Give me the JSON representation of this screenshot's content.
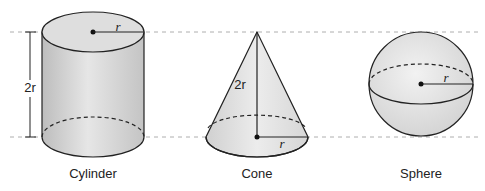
{
  "figure": {
    "shapes": [
      {
        "name": "Cylinder",
        "height_label": "2r",
        "radius_label": "r"
      },
      {
        "name": "Cone",
        "height_label": "2r",
        "radius_label": "r"
      },
      {
        "name": "Sphere",
        "radius_label": "r"
      }
    ]
  },
  "colors": {
    "fill": "#d9d9d9",
    "fill_light": "#eeeeee",
    "stroke": "#222222",
    "guide": "#999999"
  }
}
